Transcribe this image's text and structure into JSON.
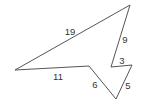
{
  "diagram": {
    "type": "polygon",
    "stroke_color": "#555555",
    "vertices": [
      {
        "x": 130,
        "y": 5
      },
      {
        "x": 111,
        "y": 67
      },
      {
        "x": 132,
        "y": 65
      },
      {
        "x": 116,
        "y": 99
      },
      {
        "x": 89,
        "y": 66
      },
      {
        "x": 15,
        "y": 70
      }
    ],
    "sides": [
      {
        "label": "19",
        "x": 70,
        "y": 35
      },
      {
        "label": "9",
        "x": 125,
        "y": 43
      },
      {
        "label": "3",
        "x": 122,
        "y": 64
      },
      {
        "label": "5",
        "x": 128,
        "y": 89
      },
      {
        "label": "6",
        "x": 95,
        "y": 88
      },
      {
        "label": "11",
        "x": 58,
        "y": 80
      }
    ]
  }
}
